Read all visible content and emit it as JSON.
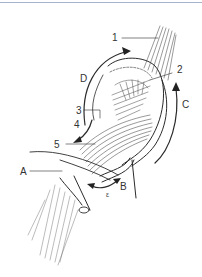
{
  "figure": {
    "border_color": "#a9b4cc",
    "line_color": "#2b2b2b",
    "labels": {
      "n1": "1",
      "n2": "2",
      "n3": "3",
      "n4": "4",
      "n5": "5",
      "A": "A",
      "B": "B",
      "C": "C",
      "D": "D",
      "mark": "ε"
    }
  }
}
